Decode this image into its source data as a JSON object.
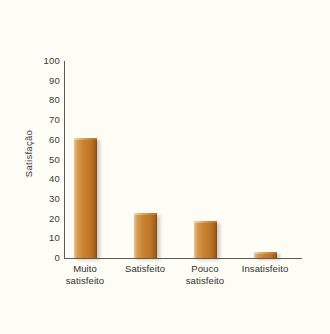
{
  "chart_data": {
    "type": "bar",
    "title": "",
    "subtitle": "",
    "xlabel": "",
    "ylabel": "Satisfação",
    "categories": [
      "Muito satisfeito",
      "Satisfeito",
      "Pouco satisfeito",
      "Insatisfeito"
    ],
    "category_lines": [
      [
        "Muito",
        "satisfeito"
      ],
      [
        "Satisfeito",
        ""
      ],
      [
        "Pouco",
        "satisfeito"
      ],
      [
        "Insatisfeito",
        ""
      ]
    ],
    "values": [
      61,
      23,
      19,
      3
    ],
    "ylim": [
      0,
      100
    ],
    "ytick_step": 10,
    "ytick_labels": [
      "100",
      "90",
      "80",
      "70",
      "60",
      "50",
      "40",
      "30",
      "20",
      "10",
      "0"
    ],
    "grid": false,
    "legend": false,
    "legend_position": "none",
    "bar_color": "#c8822f",
    "bar_highlight_color": "#e8c79b",
    "bar_shadow_color": "#7d4513",
    "axis_color": "#5c5b55",
    "text_color": "#2f2f2c",
    "background_color": "#fdfdf6"
  }
}
